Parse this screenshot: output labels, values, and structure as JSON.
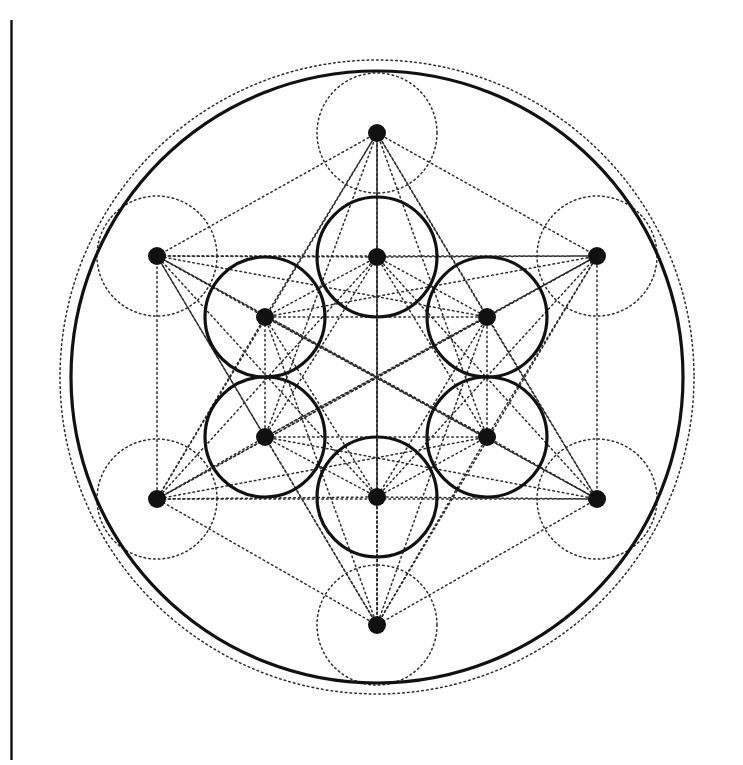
{
  "figure": {
    "canvas": {
      "width": 743,
      "height": 765,
      "background": "#ffffff"
    },
    "colors": {
      "stroke_solid": "#111111",
      "stroke_dotted": "#2b2b2b",
      "node_fill": "#111111",
      "margin_rule": "#111111",
      "background": "#ffffff"
    },
    "strokes": {
      "solid_width": 3.2,
      "dotted_width": 1.5,
      "dot_dasharray": "1.6 3.2",
      "margin_rule_width": 2.4
    },
    "center": {
      "x": 377,
      "y": 377
    },
    "radii": {
      "unit_circle": 60,
      "inner_ring": 120,
      "outer_ring": 243,
      "solid_boundary": 306,
      "dotted_boundary": 317
    },
    "margin_rule": {
      "x": 11.5,
      "y_top": 20,
      "y_bottom": 760
    },
    "counts": {
      "nodes_total": 12,
      "inner_nodes": 6,
      "outer_nodes": 6,
      "solid_unit_circles": 6,
      "dotted_unit_circles": 6,
      "boundary_circles": 2
    },
    "node_radius": 9,
    "nodes": [
      {
        "id": "n0",
        "label": "inner-top",
        "ring": "inner",
        "x": 377,
        "y": 257
      },
      {
        "id": "n1",
        "label": "inner-upper-right",
        "ring": "inner",
        "x": 487,
        "y": 317
      },
      {
        "id": "n2",
        "label": "inner-lower-right",
        "ring": "inner",
        "x": 487,
        "y": 437
      },
      {
        "id": "n3",
        "label": "inner-bottom",
        "ring": "inner",
        "x": 377,
        "y": 497
      },
      {
        "id": "n4",
        "label": "inner-lower-left",
        "ring": "inner",
        "x": 265,
        "y": 437
      },
      {
        "id": "n5",
        "label": "inner-upper-left",
        "ring": "inner",
        "x": 265,
        "y": 317
      },
      {
        "id": "n6",
        "label": "outer-top",
        "ring": "outer",
        "x": 377,
        "y": 133
      },
      {
        "id": "n7",
        "label": "outer-upper-right",
        "ring": "outer",
        "x": 597,
        "y": 256
      },
      {
        "id": "n8",
        "label": "outer-lower-right",
        "ring": "outer",
        "x": 597,
        "y": 499
      },
      {
        "id": "n9",
        "label": "outer-bottom",
        "ring": "outer",
        "x": 377,
        "y": 625
      },
      {
        "id": "n10",
        "label": "outer-lower-left",
        "ring": "outer",
        "x": 157,
        "y": 499
      },
      {
        "id": "n11",
        "label": "outer-upper-left",
        "ring": "outer",
        "x": 157,
        "y": 256
      }
    ],
    "solid_circles": [
      {
        "label": "unit-circle-inner-top",
        "cx": 377,
        "cy": 257,
        "r": 60
      },
      {
        "label": "unit-circle-inner-upper-right",
        "cx": 487,
        "cy": 317,
        "r": 60
      },
      {
        "label": "unit-circle-inner-lower-right",
        "cx": 487,
        "cy": 437,
        "r": 60
      },
      {
        "label": "unit-circle-inner-bottom",
        "cx": 377,
        "cy": 497,
        "r": 60
      },
      {
        "label": "unit-circle-inner-lower-left",
        "cx": 265,
        "cy": 437,
        "r": 60
      },
      {
        "label": "unit-circle-inner-upper-left",
        "cx": 265,
        "cy": 317,
        "r": 60
      },
      {
        "label": "boundary-circle-solid",
        "cx": 377,
        "cy": 377,
        "r": 306
      }
    ],
    "dotted_circles": [
      {
        "label": "unit-circle-outer-top",
        "cx": 377,
        "cy": 133,
        "r": 60
      },
      {
        "label": "unit-circle-outer-upper-right",
        "cx": 597,
        "cy": 256,
        "r": 60
      },
      {
        "label": "unit-circle-outer-lower-right",
        "cx": 597,
        "cy": 499,
        "r": 60
      },
      {
        "label": "unit-circle-outer-bottom",
        "cx": 377,
        "cy": 625,
        "r": 60
      },
      {
        "label": "unit-circle-outer-lower-left",
        "cx": 157,
        "cy": 499,
        "r": 60
      },
      {
        "label": "unit-circle-outer-upper-left",
        "cx": 157,
        "cy": 256,
        "r": 60
      },
      {
        "label": "boundary-circle-dotted",
        "cx": 377,
        "cy": 377,
        "r": 317
      }
    ]
  },
  "chart_data": {
    "type": "scatter",
    "xlabel": "",
    "ylabel": "",
    "grid": false,
    "legend": "none",
    "xlim": [
      0,
      743
    ],
    "ylim": [
      0,
      765
    ],
    "note": "13-point sacred-geometry lattice: 6 inner vertices (r=120) and 6 outer vertices (r=243) about a common centre, fully connected by dotted chords; unit circles of r=60 drawn solid on inner vertices and dotted on outer vertices; bounding circle r=306 solid with concentric dotted circle r=317.",
    "points": [
      {
        "label": "inner-top",
        "x": 377,
        "y": 257
      },
      {
        "label": "inner-upper-right",
        "x": 487,
        "y": 317
      },
      {
        "label": "inner-lower-right",
        "x": 487,
        "y": 437
      },
      {
        "label": "inner-bottom",
        "x": 377,
        "y": 497
      },
      {
        "label": "inner-lower-left",
        "x": 265,
        "y": 437
      },
      {
        "label": "inner-upper-left",
        "x": 265,
        "y": 317
      },
      {
        "label": "outer-top",
        "x": 377,
        "y": 133
      },
      {
        "label": "outer-upper-right",
        "x": 597,
        "y": 256
      },
      {
        "label": "outer-lower-right",
        "x": 597,
        "y": 499
      },
      {
        "label": "outer-bottom",
        "x": 377,
        "y": 625
      },
      {
        "label": "outer-lower-left",
        "x": 157,
        "y": 499
      },
      {
        "label": "outer-upper-left",
        "x": 157,
        "y": 256
      }
    ]
  }
}
